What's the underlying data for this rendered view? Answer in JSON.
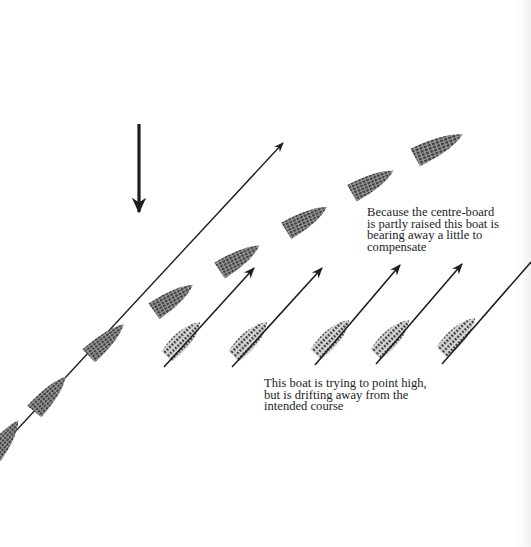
{
  "diagram": {
    "wind_arrow": {
      "label": "wind-direction",
      "x": 139,
      "y1": 124,
      "y2": 212
    },
    "course_line": {
      "x1": 0,
      "y1": 448,
      "x2": 283,
      "y2": 143
    },
    "boats_upper_row": [
      {
        "cx": 442,
        "cy": 148,
        "angle": -20,
        "kind": "centreboard-raised"
      },
      {
        "cx": 373,
        "cy": 184,
        "angle": -22,
        "kind": "centreboard-raised"
      },
      {
        "cx": 306,
        "cy": 220,
        "angle": -24,
        "kind": "centreboard-raised"
      },
      {
        "cx": 240,
        "cy": 259,
        "angle": -26,
        "kind": "centreboard-raised"
      },
      {
        "cx": 172,
        "cy": 300,
        "angle": -28,
        "kind": "centreboard-raised"
      }
    ],
    "boats_on_course": [
      {
        "cx": 105,
        "cy": 342,
        "angle": -38
      },
      {
        "cx": 49,
        "cy": 395,
        "angle": -44
      },
      {
        "cx": 5,
        "cy": 440,
        "angle": -48
      }
    ],
    "boats_lower_row": [
      {
        "cx": 185,
        "cy": 337,
        "angle": -50,
        "arrow": {
          "x1": 164,
          "y1": 367,
          "x2": 254,
          "y2": 268
        }
      },
      {
        "cx": 251,
        "cy": 337,
        "angle": -50,
        "arrow": {
          "x1": 232,
          "y1": 367,
          "x2": 322,
          "y2": 268
        }
      },
      {
        "cx": 333,
        "cy": 335,
        "angle": -50,
        "arrow": {
          "x1": 315,
          "y1": 365,
          "x2": 400,
          "y2": 265
        }
      },
      {
        "cx": 393,
        "cy": 335,
        "angle": -50,
        "arrow": {
          "x1": 376,
          "y1": 364,
          "x2": 462,
          "y2": 264
        }
      },
      {
        "cx": 459,
        "cy": 333,
        "angle": -50,
        "arrow": {
          "x1": 442,
          "y1": 364,
          "x2": 531,
          "y2": 262
        }
      }
    ]
  },
  "captions": {
    "centreboard": {
      "lines": [
        "Because the centre-board",
        "is partly raised this boat is",
        "bearing away a little to",
        "compensate"
      ]
    },
    "point_high": {
      "lines": [
        "This boat is trying to point high,",
        "but is drifting away from the",
        "intended course"
      ]
    }
  },
  "colors": {
    "ink": "#1e1e1e",
    "hull_fill": "#5a5a5a",
    "hull_light": "#8a8a8a",
    "page_edge": "#f1f1f1"
  }
}
